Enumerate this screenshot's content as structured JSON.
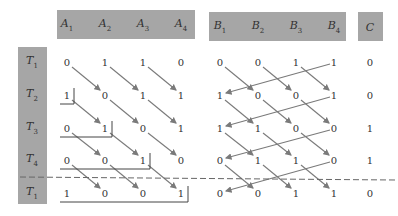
{
  "headers": {
    "A": [
      {
        "base": "A",
        "sub": "1"
      },
      {
        "base": "A",
        "sub": "2"
      },
      {
        "base": "A",
        "sub": "3"
      },
      {
        "base": "A",
        "sub": "4"
      }
    ],
    "B": [
      {
        "base": "B",
        "sub": "1"
      },
      {
        "base": "B",
        "sub": "2"
      },
      {
        "base": "B",
        "sub": "3"
      },
      {
        "base": "B",
        "sub": "4"
      }
    ],
    "C": [
      {
        "base": "C",
        "sub": ""
      }
    ]
  },
  "rows": [
    {
      "label": {
        "base": "T",
        "sub": "1"
      },
      "A": [
        "0",
        "1",
        "1",
        "0"
      ],
      "B": [
        "0",
        "0",
        "1",
        "1"
      ],
      "C": "0"
    },
    {
      "label": {
        "base": "T",
        "sub": "2"
      },
      "A": [
        "1",
        "0",
        "1",
        "1"
      ],
      "B": [
        "1",
        "0",
        "0",
        "1"
      ],
      "C": "0"
    },
    {
      "label": {
        "base": "T",
        "sub": "3"
      },
      "A": [
        "0",
        "1",
        "0",
        "1"
      ],
      "B": [
        "1",
        "1",
        "0",
        "0"
      ],
      "C": "1"
    },
    {
      "label": {
        "base": "T",
        "sub": "4"
      },
      "A": [
        "0",
        "0",
        "1",
        "0"
      ],
      "B": [
        "0",
        "1",
        "1",
        "0"
      ],
      "C": "1"
    },
    {
      "label": {
        "base": "T",
        "sub": "1"
      },
      "A": [
        "1",
        "0",
        "0",
        "1"
      ],
      "B": [
        "0",
        "0",
        "1",
        "1"
      ],
      "C": "0"
    }
  ],
  "colors": {
    "header_fill": "#a6a6a6",
    "arrow": "#7a7a7a",
    "text": "#333333",
    "bracket": "#444444",
    "dashed_line": "#666666"
  }
}
